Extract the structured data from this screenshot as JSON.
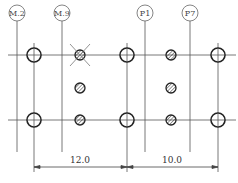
{
  "drawing": {
    "grid_labels": [
      {
        "id": "m2",
        "text": "M.2",
        "x": 17
      },
      {
        "id": "m9",
        "text": "M.9",
        "x": 62
      },
      {
        "id": "p1",
        "text": "P1",
        "x": 145
      },
      {
        "id": "p7",
        "text": "P7",
        "x": 190
      }
    ],
    "rows_y": [
      55,
      120
    ],
    "columns_x": [
      34,
      127,
      218
    ],
    "hatched_x": [
      80,
      171
    ],
    "hatched_y": [
      55,
      88,
      120
    ],
    "crossed_hole": {
      "x": 80,
      "y": 55
    },
    "dimensions": [
      {
        "from": 34,
        "to": 127,
        "label": "12.0"
      },
      {
        "from": 127,
        "to": 218,
        "label": "10.0"
      }
    ]
  },
  "colors": {
    "line": "#555555",
    "outline": "#222222",
    "background": "#ffffff"
  }
}
